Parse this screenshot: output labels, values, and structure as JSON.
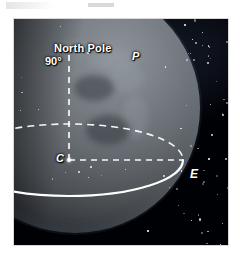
{
  "figure": {
    "kind": "astronomy-diagram",
    "background_color": "#000105",
    "line_color": "#ffffff",
    "globe_color": "#6a6e72",
    "page_background": "#ffffff"
  },
  "labels": {
    "north_pole": "North Pole",
    "pole_altitude": "90°",
    "point_p": "P",
    "center_c": "C",
    "point_e": "E"
  },
  "markers": [
    {
      "id": "pole-marker",
      "label": "90°",
      "x": 69,
      "y": 48
    },
    {
      "id": "center-marker",
      "label": "C",
      "x": 69,
      "y": 160
    },
    {
      "id": "east-marker",
      "label": "E",
      "x": 183,
      "y": 160
    }
  ],
  "geometry": {
    "ellipse_center_x": 69,
    "ellipse_center_y": 160,
    "ellipse_rx": 114,
    "ellipse_ry": 36,
    "axis_top_y": 48,
    "axis_bottom_y": 160,
    "front_arc_style": "solid",
    "back_arc_style": "dashed",
    "radius_style": "dashed",
    "axis_style": "dashed"
  },
  "chart_data": {
    "type": "scatter",
    "title": "",
    "xlabel": "",
    "ylabel": "",
    "annotations": [
      "North Pole",
      "90°",
      "P",
      "C",
      "E"
    ],
    "points": [
      {
        "name": "North Pole (90°)",
        "x": 69,
        "y": 48
      },
      {
        "name": "P",
        "x": 122,
        "y": 38
      },
      {
        "name": "C",
        "x": 69,
        "y": 160
      },
      {
        "name": "E",
        "x": 183,
        "y": 160
      }
    ],
    "grid": false,
    "legend": "none"
  }
}
